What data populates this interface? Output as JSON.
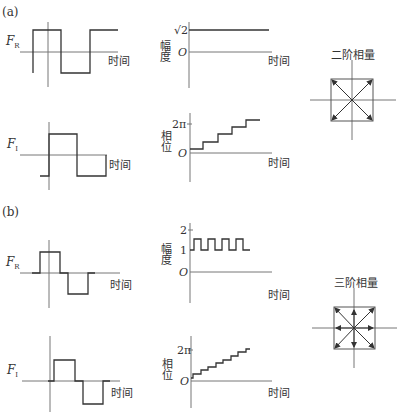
{
  "panels": {
    "a": {
      "label": "(a)",
      "fr_label": "F",
      "fr_sub": "R",
      "fi_label": "F",
      "fi_sub": "I",
      "time_label": "时间",
      "amplitude": {
        "ylabel": "幅度",
        "ticks": [
          "√2",
          "O"
        ]
      },
      "phase": {
        "ylabel": "相位",
        "ticks": [
          "2π",
          "O"
        ]
      },
      "constellation_title": "二阶相量"
    },
    "b": {
      "label": "(b)",
      "fr_label": "F",
      "fr_sub": "R",
      "fi_label": "F",
      "fi_sub": "I",
      "time_label": "时间",
      "amplitude": {
        "ylabel": "幅度",
        "ticks": [
          "2",
          "1",
          "O"
        ]
      },
      "phase": {
        "ylabel": "相位",
        "ticks": [
          "2π",
          "O"
        ]
      },
      "constellation_title": "三阶相量"
    }
  },
  "colors": {
    "line": "#333333",
    "axis": "#777777"
  }
}
